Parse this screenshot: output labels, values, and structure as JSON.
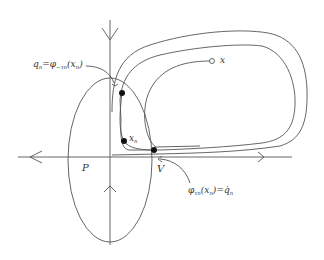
{
  "diagram": {
    "type": "phase-portrait",
    "colors": {
      "stroke": "#555555",
      "point": "#111111",
      "text": "#333333",
      "background": "#ffffff"
    },
    "labels": {
      "q_n_main": "q",
      "q_n_sub": "n",
      "eq1": "=",
      "phi": "φ",
      "phi_sub_neg": "−τ",
      "phi_sub_neg_n": "n",
      "paren_open": "(",
      "x_main": "x",
      "x_sub": "n",
      "paren_close": ")",
      "x_label": "x",
      "P_label": "P",
      "V_label": "V",
      "x_n_main": "x",
      "x_n_sub": "n",
      "phi2": "φ",
      "phi2_sub": "τ",
      "phi2_sub_n": "n",
      "eq2": "=",
      "qdot_main": "q̇",
      "qdot_sub": "n"
    },
    "points": [
      {
        "name": "q_n",
        "x": 122,
        "y": 93,
        "filled": true
      },
      {
        "name": "x_n",
        "x": 124,
        "y": 141,
        "filled": true
      },
      {
        "name": "V_point",
        "x": 154,
        "y": 150,
        "filled": true
      },
      {
        "name": "x",
        "x": 212,
        "y": 61,
        "filled": false
      }
    ],
    "regions": [
      {
        "name": "P",
        "shape": "ellipse",
        "cx": 110,
        "cy": 160,
        "rx": 42,
        "ry": 82
      }
    ]
  }
}
